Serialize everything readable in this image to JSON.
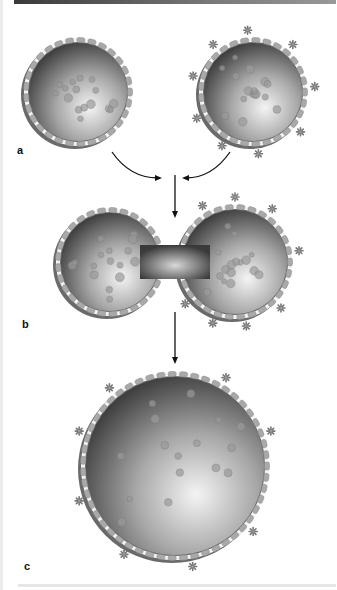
{
  "figure": {
    "panels": [
      {
        "id": "a",
        "label": "a",
        "description": "Two separate vesicles; right vesicle carries surface markers"
      },
      {
        "id": "b",
        "label": "b",
        "description": "Vesicles fusing into a dumbbell shape"
      },
      {
        "id": "c",
        "label": "c",
        "description": "Single fused vesicle with markers distributed"
      }
    ],
    "colors": {
      "interior_dark": "#3c3c3c",
      "interior_light": "#f2f2f2",
      "membrane_outer": "#6e6e6e",
      "membrane_band": "#f4f4f4",
      "protein": "#a9a9a9",
      "marker": "#777777",
      "arrow": "#111111"
    },
    "icons": {
      "marker": "asterisk-marker-icon",
      "arrow": "arrow-icon"
    }
  }
}
